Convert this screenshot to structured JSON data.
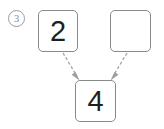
{
  "figure": {
    "marker_label": "3",
    "marker_style": "circled-number",
    "background_color": "#ffffff",
    "box_border_color": "#8a8a8a",
    "digit_color": "#1f1f1f",
    "arrow_color": "#9d9d9d"
  },
  "nodes": {
    "left": {
      "label": "2",
      "empty": false
    },
    "right": {
      "label": "",
      "empty": true
    },
    "bottom": {
      "label": "4",
      "empty": false
    }
  },
  "edges": [
    {
      "from": "left",
      "to": "bottom",
      "style": "dashed-arrow"
    },
    {
      "from": "right",
      "to": "bottom",
      "style": "dashed-arrow"
    }
  ]
}
